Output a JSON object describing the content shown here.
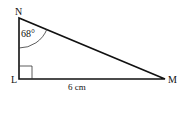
{
  "diagram": {
    "type": "right-triangle",
    "vertices": {
      "N": {
        "label": "N",
        "x": 19,
        "y": 18
      },
      "L": {
        "label": "L",
        "x": 19,
        "y": 79
      },
      "M": {
        "label": "M",
        "x": 165,
        "y": 79
      }
    },
    "angle_N_label": "68°",
    "side_LM_label": "6 cm",
    "right_angle_at": "L",
    "colors": {
      "stroke": "#111111",
      "background": "#ffffff"
    }
  }
}
